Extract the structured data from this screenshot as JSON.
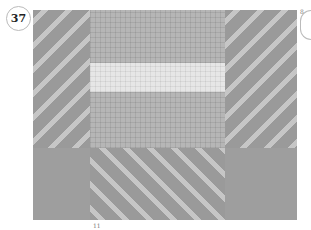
{
  "figure": {
    "number": "37",
    "regions": [
      {
        "name": "left-strip",
        "pattern": "diagonal twill"
      },
      {
        "name": "center-grid",
        "pattern": "plain grid"
      },
      {
        "name": "center-light-band",
        "pattern": "light grid band"
      },
      {
        "name": "right-strip",
        "pattern": "diagonal twill"
      },
      {
        "name": "bottom-center",
        "pattern": "diagonal twill"
      },
      {
        "name": "bottom-left",
        "pattern": "solid"
      },
      {
        "name": "bottom-right",
        "pattern": "solid"
      }
    ],
    "colors": {
      "dark": "#9e9e9e",
      "mid": "#b6b6b6",
      "light": "#e6e6e6",
      "float": "#c6c6c6"
    },
    "corner_mark": "8",
    "bottom_mark": "11"
  }
}
